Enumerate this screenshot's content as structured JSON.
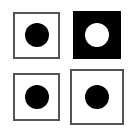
{
  "figure": {
    "panels": [
      {
        "id": "top-left",
        "box": {
          "x": 13,
          "y": 12,
          "w": 47,
          "h": 47,
          "fill": "#ffffff",
          "border": "#555555",
          "border_width": 2
        },
        "dot": {
          "cx": 37,
          "cy": 35,
          "r": 12,
          "fill": "#000000"
        }
      },
      {
        "id": "top-right",
        "box": {
          "x": 73,
          "y": 11,
          "w": 48,
          "h": 48,
          "fill": "#000000",
          "border": "#000000",
          "border_width": 0
        },
        "dot": {
          "cx": 97,
          "cy": 35,
          "r": 12,
          "fill": "#ffffff"
        }
      },
      {
        "id": "bottom-left",
        "box": {
          "x": 13,
          "y": 73,
          "w": 47,
          "h": 48,
          "fill": "#ffffff",
          "border": "#555555",
          "border_width": 2
        },
        "dot": {
          "cx": 37,
          "cy": 97,
          "r": 12,
          "fill": "#000000"
        }
      },
      {
        "id": "bottom-right",
        "box": {
          "x": 70,
          "y": 69,
          "w": 54,
          "h": 56,
          "fill": "#ffffff",
          "border": "#555555",
          "border_width": 2
        },
        "dot": {
          "cx": 97,
          "cy": 97,
          "r": 12,
          "fill": "#000000"
        }
      }
    ]
  }
}
